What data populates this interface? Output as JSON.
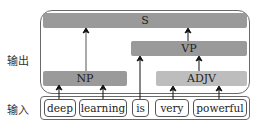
{
  "labels": {
    "output": "输出",
    "input": "输入"
  },
  "nodes": {
    "s": "S",
    "vp": "VP",
    "np": "NP",
    "adjv": "ADJV"
  },
  "words": [
    "deep",
    "learning",
    "is",
    "very",
    "powerful"
  ],
  "colors": {
    "dark_bar": "#9a9a9a",
    "light_bar": "#bdbdbd",
    "border": "#6a6a6a",
    "arrow": "#111111"
  },
  "edges": [
    {
      "from": "deep",
      "to": "NP"
    },
    {
      "from": "learning",
      "to": "NP"
    },
    {
      "from": "NP",
      "to": "S"
    },
    {
      "from": "is",
      "to": "VP"
    },
    {
      "from": "very",
      "to": "ADJV"
    },
    {
      "from": "powerful",
      "to": "ADJV"
    },
    {
      "from": "ADJV",
      "to": "VP"
    },
    {
      "from": "VP",
      "to": "S"
    }
  ]
}
